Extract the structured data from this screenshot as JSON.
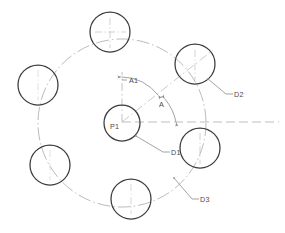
{
  "drawing": {
    "title": "Bolt Circle Hole Pattern",
    "type": "cad-technical-drawing",
    "canvas": {
      "width": 285,
      "height": 233
    },
    "colors": {
      "background": "#ffffff",
      "hole_outline": "#3b3b3b",
      "center_circle_outline": "#3b3b3b",
      "pitch_circle": "#a8a8a8",
      "centerline": "#b0b0b0",
      "dimension_line": "#8c8c8c",
      "leader_line": "#8c8c8c",
      "text": "#4a4a4a"
    },
    "geometry": {
      "pattern_center": {
        "x": 122,
        "y": 123
      },
      "pitch_circle_radius": 84,
      "center_circle_radius": 18,
      "hole_radius": 20,
      "hole_count": 6,
      "holes": [
        {
          "id": "hole-1",
          "cx": 195,
          "cy": 64,
          "r": 20,
          "angle_deg": 39
        },
        {
          "id": "hole-2",
          "cx": 110,
          "cy": 32,
          "r": 20,
          "angle_deg": 98
        },
        {
          "id": "hole-3",
          "cx": 38,
          "cy": 85,
          "r": 20,
          "angle_deg": 155
        },
        {
          "id": "hole-4",
          "cx": 50,
          "cy": 165,
          "r": 20,
          "angle_deg": 210
        },
        {
          "id": "hole-5",
          "cx": 131,
          "cy": 199,
          "r": 20,
          "angle_deg": 273
        },
        {
          "id": "hole-6",
          "cx": 200,
          "cy": 148,
          "r": 20,
          "angle_deg": 340
        }
      ]
    },
    "labels": {
      "center_point": "P1",
      "angle_1": "A1",
      "angle_2": "A",
      "diameter_1": "D1",
      "diameter_2": "D2",
      "diameter_3": "D3"
    },
    "annotations": [
      {
        "name": "P1",
        "text": "P1",
        "x": 109,
        "y": 128,
        "kind": "point-label"
      },
      {
        "name": "A1",
        "text": "A1",
        "x": 129,
        "y": 83,
        "kind": "angle-dimension"
      },
      {
        "name": "A",
        "text": "A",
        "x": 161,
        "y": 104,
        "kind": "angle-dimension"
      },
      {
        "name": "D1",
        "text": "D1",
        "x": 168,
        "y": 154,
        "kind": "diameter-leader"
      },
      {
        "name": "D2",
        "text": "D2",
        "x": 233,
        "y": 96,
        "kind": "diameter-leader"
      },
      {
        "name": "D3",
        "text": "D3",
        "x": 199,
        "y": 202,
        "kind": "diameter-leader"
      }
    ]
  }
}
